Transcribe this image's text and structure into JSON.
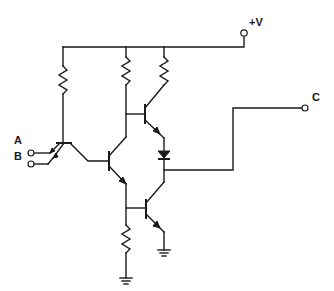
{
  "diagram": {
    "type": "circuit-schematic",
    "labels": {
      "supply": "+V",
      "input_a": "A",
      "input_b": "B",
      "output": "C"
    },
    "components": {
      "resistors": [
        "R1 input pull-up",
        "R2 phase-splitter collector",
        "R3 upper output collector",
        "R4 phase-splitter emitter"
      ],
      "transistors": [
        "Q1 multi-emitter input",
        "Q2 phase splitter",
        "Q3 upper output",
        "Q4 lower output"
      ],
      "diodes": [
        "D1 series diode"
      ],
      "grounds": 2,
      "terminals": [
        "+V",
        "A",
        "B",
        "C"
      ]
    },
    "colors": {
      "ink": "#1a1a1a",
      "background": "#ffffff"
    }
  }
}
